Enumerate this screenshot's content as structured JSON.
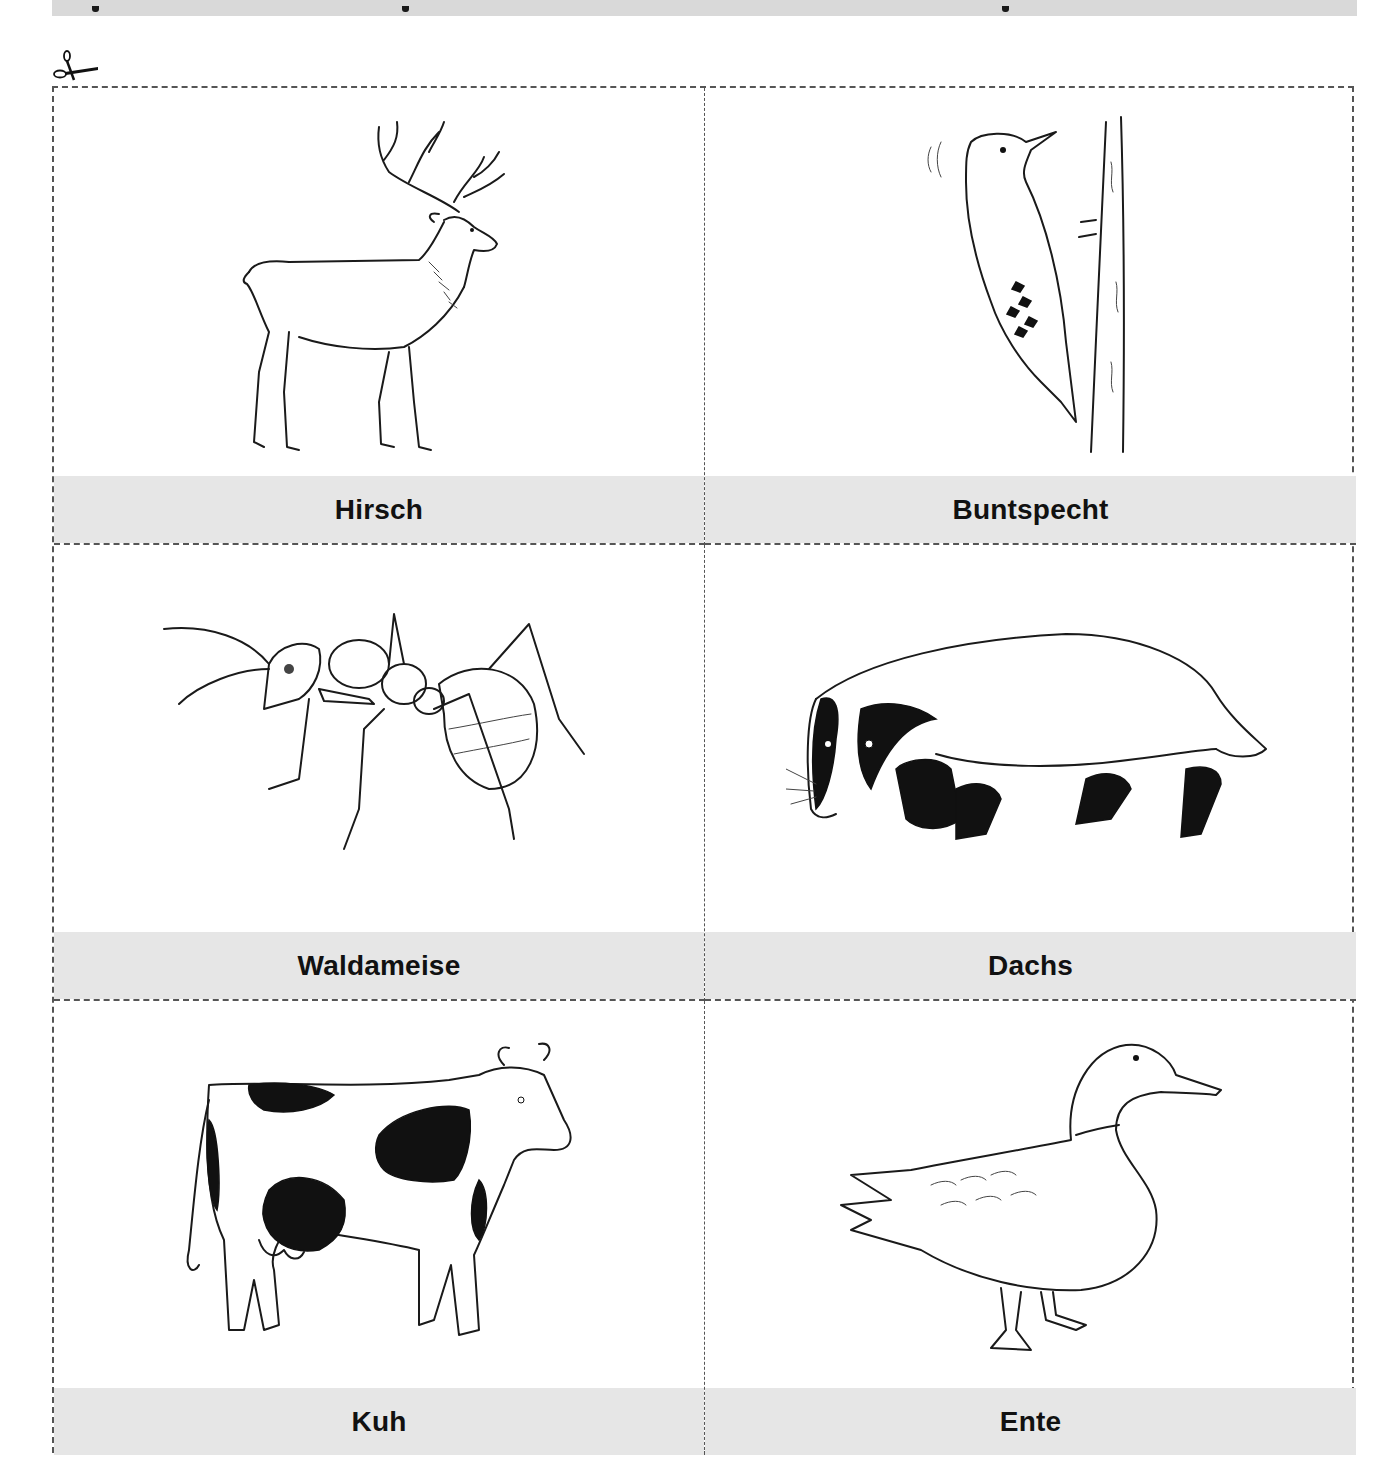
{
  "page": {
    "type": "worksheet",
    "layout": "2-column cut-out card grid",
    "label_band_color": "#e6e6e6",
    "border_style": "dashed",
    "border_color": "#555555"
  },
  "header": {
    "title_visible": false,
    "note": ""
  },
  "cut_marker": {
    "icon": "scissors-icon"
  },
  "cards": [
    {
      "label": "Hirsch",
      "illustration": "deer-stag-icon"
    },
    {
      "label": "Buntspecht",
      "illustration": "woodpecker-icon"
    },
    {
      "label": "Waldameise",
      "illustration": "ant-icon"
    },
    {
      "label": "Dachs",
      "illustration": "badger-icon"
    },
    {
      "label": "Kuh",
      "illustration": "cow-icon"
    },
    {
      "label": "Ente",
      "illustration": "duck-icon"
    }
  ]
}
